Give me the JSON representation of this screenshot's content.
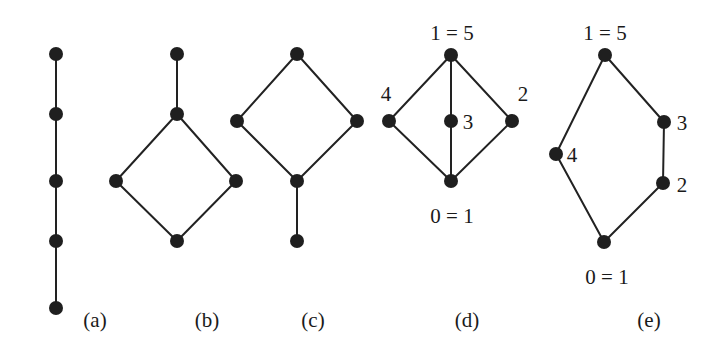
{
  "figure": {
    "colors": {
      "ink": "#1f1f1f",
      "edge": "#222222",
      "background": "#ffffff"
    },
    "node_radius": 7,
    "diagrams": [
      {
        "id": "a",
        "caption": "(a)",
        "caption_pos": [
          95,
          327
        ],
        "nodes": [
          {
            "id": "a1",
            "x": 56,
            "y": 54
          },
          {
            "id": "a2",
            "x": 56,
            "y": 114
          },
          {
            "id": "a3",
            "x": 56,
            "y": 181
          },
          {
            "id": "a4",
            "x": 56,
            "y": 241
          },
          {
            "id": "a5",
            "x": 56,
            "y": 308
          }
        ],
        "edges": [
          [
            "a1",
            "a2"
          ],
          [
            "a2",
            "a3"
          ],
          [
            "a3",
            "a4"
          ],
          [
            "a4",
            "a5"
          ]
        ],
        "labels": []
      },
      {
        "id": "b",
        "caption": "(b)",
        "caption_pos": [
          207,
          327
        ],
        "nodes": [
          {
            "id": "b1",
            "x": 177,
            "y": 54
          },
          {
            "id": "b2",
            "x": 177,
            "y": 114
          },
          {
            "id": "b3",
            "x": 116,
            "y": 181
          },
          {
            "id": "b4",
            "x": 236,
            "y": 181
          },
          {
            "id": "b5",
            "x": 177,
            "y": 241
          }
        ],
        "edges": [
          [
            "b1",
            "b2"
          ],
          [
            "b2",
            "b3"
          ],
          [
            "b2",
            "b4"
          ],
          [
            "b3",
            "b5"
          ],
          [
            "b4",
            "b5"
          ]
        ],
        "labels": []
      },
      {
        "id": "c",
        "caption": "(c)",
        "caption_pos": [
          313,
          327
        ],
        "nodes": [
          {
            "id": "c1",
            "x": 297,
            "y": 54
          },
          {
            "id": "c2",
            "x": 237,
            "y": 121
          },
          {
            "id": "c3",
            "x": 357,
            "y": 121
          },
          {
            "id": "c4",
            "x": 297,
            "y": 181
          },
          {
            "id": "c5",
            "x": 297,
            "y": 241
          }
        ],
        "edges": [
          [
            "c1",
            "c2"
          ],
          [
            "c1",
            "c3"
          ],
          [
            "c2",
            "c4"
          ],
          [
            "c3",
            "c4"
          ],
          [
            "c4",
            "c5"
          ]
        ],
        "labels": []
      },
      {
        "id": "d",
        "caption": "(d)",
        "caption_pos": [
          467,
          327
        ],
        "nodes": [
          {
            "id": "d1",
            "x": 451,
            "y": 55
          },
          {
            "id": "d2",
            "x": 389,
            "y": 121
          },
          {
            "id": "d3",
            "x": 451,
            "y": 121
          },
          {
            "id": "d4",
            "x": 512,
            "y": 121
          },
          {
            "id": "d5",
            "x": 451,
            "y": 181
          }
        ],
        "edges": [
          [
            "d1",
            "d2"
          ],
          [
            "d1",
            "d3"
          ],
          [
            "d1",
            "d4"
          ],
          [
            "d2",
            "d5"
          ],
          [
            "d3",
            "d5"
          ],
          [
            "d4",
            "d5"
          ]
        ],
        "labels": [
          {
            "text": "1 = 5",
            "x": 452,
            "y": 40,
            "anchor": "middle"
          },
          {
            "text": "4",
            "x": 386,
            "y": 101,
            "anchor": "middle"
          },
          {
            "text": "3",
            "x": 468,
            "y": 129,
            "anchor": "middle"
          },
          {
            "text": "2",
            "x": 523,
            "y": 101,
            "anchor": "middle"
          },
          {
            "text": "0 = 1",
            "x": 452,
            "y": 223,
            "anchor": "middle"
          }
        ]
      },
      {
        "id": "e",
        "caption": "(e)",
        "caption_pos": [
          649,
          327
        ],
        "nodes": [
          {
            "id": "e1",
            "x": 605,
            "y": 55
          },
          {
            "id": "e2",
            "x": 664,
            "y": 122
          },
          {
            "id": "e3",
            "x": 556,
            "y": 154
          },
          {
            "id": "e4",
            "x": 663,
            "y": 183
          },
          {
            "id": "e5",
            "x": 604,
            "y": 242
          }
        ],
        "edges": [
          [
            "e1",
            "e2"
          ],
          [
            "e1",
            "e3"
          ],
          [
            "e2",
            "e4"
          ],
          [
            "e3",
            "e5"
          ],
          [
            "e4",
            "e5"
          ]
        ],
        "labels": [
          {
            "text": "1 = 5",
            "x": 605,
            "y": 40,
            "anchor": "middle"
          },
          {
            "text": "3",
            "x": 682,
            "y": 130,
            "anchor": "middle"
          },
          {
            "text": "4",
            "x": 572,
            "y": 162,
            "anchor": "middle"
          },
          {
            "text": "2",
            "x": 682,
            "y": 192,
            "anchor": "middle"
          },
          {
            "text": "0 = 1",
            "x": 607,
            "y": 284,
            "anchor": "middle"
          }
        ]
      }
    ]
  }
}
